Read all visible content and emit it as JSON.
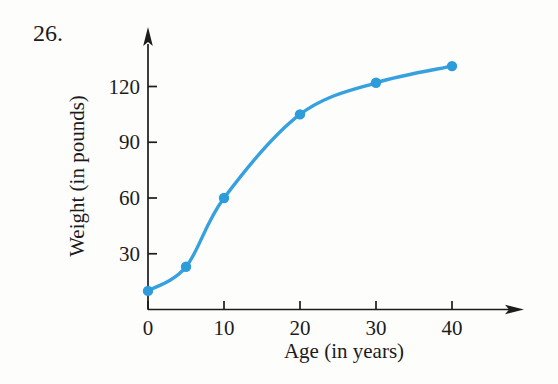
{
  "page": {
    "problem_number": "26.",
    "background_color": "#fdfdfc"
  },
  "chart_data": {
    "type": "line",
    "title": "",
    "xlabel": "Age (in years)",
    "ylabel": "Weight (in pounds)",
    "x": [
      0,
      5,
      10,
      20,
      30,
      40
    ],
    "y": [
      10,
      23,
      60,
      105,
      122,
      131
    ],
    "x_ticks": [
      0,
      10,
      20,
      30,
      40
    ],
    "y_ticks": [
      30,
      60,
      90,
      120
    ],
    "xlim": [
      0,
      49
    ],
    "ylim": [
      0,
      150
    ],
    "grid": false,
    "legend": false,
    "marker": "circle",
    "line_color": "#36a1de",
    "marker_color": "#2d9cdb",
    "axis_color": "#1c1c1c"
  }
}
